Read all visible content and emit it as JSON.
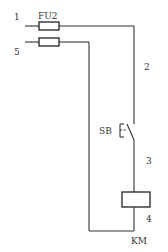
{
  "diagram": {
    "type": "electrical-control-circuit",
    "fuse": {
      "label": "FU2"
    },
    "terminals": [
      {
        "id": "1",
        "label": "1"
      },
      {
        "id": "5",
        "label": "5"
      }
    ],
    "wire_labels": [
      {
        "id": "2",
        "label": "2"
      },
      {
        "id": "3",
        "label": "3"
      },
      {
        "id": "4",
        "label": "4"
      }
    ],
    "switch": {
      "label": "SB"
    },
    "coil": {
      "label": "KM"
    },
    "colors": {
      "line": "#333333",
      "background": "#ffffff"
    }
  }
}
